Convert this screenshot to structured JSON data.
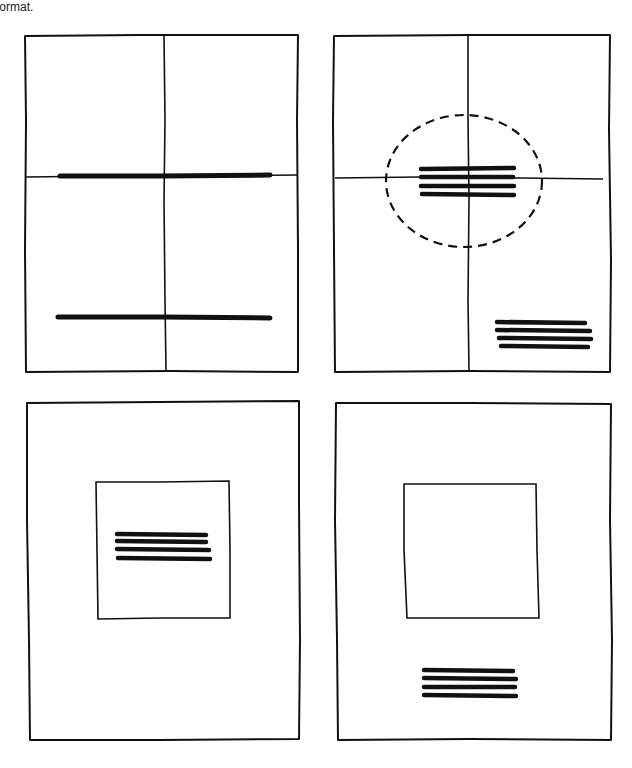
{
  "caption": "e format.",
  "diagram": {
    "type": "layout-sketch-grid",
    "panels": [
      {
        "id": "panel-1",
        "description": "Page divided into quarters; two long rules, one on the horizontal center line and one near the bottom",
        "frame": {
          "x": 25,
          "y": 35,
          "w": 273,
          "h": 337
        },
        "guides": {
          "vertical_x": 165,
          "horizontal_y": 176
        },
        "bars": [
          {
            "x1": 60,
            "y1": 176,
            "x2": 270,
            "y2": 175
          },
          {
            "x1": 58,
            "y1": 317,
            "x2": 270,
            "y2": 318
          }
        ]
      },
      {
        "id": "panel-2",
        "description": "Page divided into quarters; text block centered at the optical center inside a dashed circle, second text block at lower right",
        "frame": {
          "x": 333,
          "y": 35,
          "w": 277,
          "h": 337
        },
        "guides": {
          "vertical_x": 468,
          "horizontal_y": 178
        },
        "highlight_ellipse": {
          "cx": 464,
          "cy": 181,
          "rx": 78,
          "ry": 66
        },
        "text_blocks": [
          {
            "lines": 4,
            "x": 420,
            "y": 168,
            "w": 95,
            "h": 28
          },
          {
            "lines": 4,
            "x": 496,
            "y": 322,
            "w": 94,
            "h": 26
          }
        ]
      },
      {
        "id": "panel-3",
        "description": "Page with a centered inner square; text block placed inside the square",
        "frame": {
          "x": 26,
          "y": 402,
          "w": 274,
          "h": 338
        },
        "inner_box": {
          "x": 96,
          "y": 482,
          "w": 134,
          "h": 136
        },
        "text_blocks": [
          {
            "lines": 4,
            "x": 117,
            "y": 533,
            "w": 93,
            "h": 26
          }
        ]
      },
      {
        "id": "panel-4",
        "description": "Page with a centered inner square left empty; text block placed below the square",
        "frame": {
          "x": 335,
          "y": 402,
          "w": 277,
          "h": 338
        },
        "inner_box": {
          "x": 403,
          "y": 483,
          "w": 137,
          "h": 135
        },
        "text_blocks": [
          {
            "lines": 4,
            "x": 424,
            "y": 670,
            "w": 93,
            "h": 27
          }
        ]
      }
    ]
  }
}
